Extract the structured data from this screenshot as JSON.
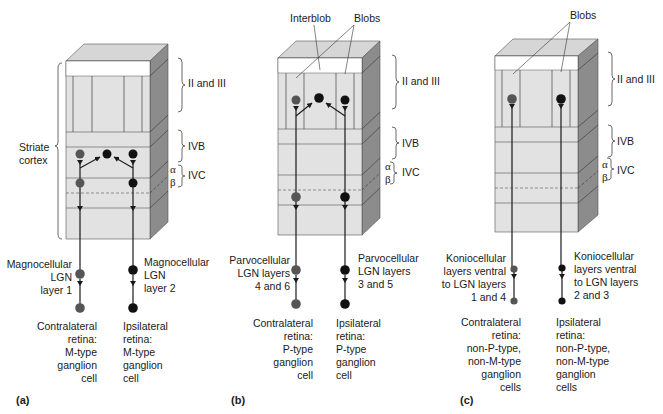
{
  "figure": {
    "colors": {
      "front_face": "#e2e2e2",
      "top_face": "#d6d6d6",
      "side_face": "#8c8c8c",
      "white_band": "#ffffff",
      "line": "#2a2a2a",
      "contralateral_neuron": "#555555",
      "ipsilateral_neuron": "#111111"
    },
    "layer_labels": {
      "layers_2_3": "II and III",
      "layer_4b": "IVB",
      "layer_4c": "IVC",
      "alpha": "α",
      "beta": "β"
    },
    "panels": [
      {
        "id": "a",
        "letter": "(a)",
        "side_label": "Striate\ncortex",
        "top_labels": [],
        "left_lgn": "Magnocellular\nLGN\nlayer 1",
        "right_lgn": "Magnocellular\nLGN\nlayer 2",
        "left_retina": "Contralateral\nretina:\nM-type\nganglion\ncell",
        "right_retina": "Ipsilateral\nretina:\nM-type\nganglion\ncell"
      },
      {
        "id": "b",
        "letter": "(b)",
        "top_labels": [
          "Interblob",
          "Blobs"
        ],
        "left_lgn": "Parvocellular\nLGN layers\n4 and 6",
        "right_lgn": "Parvocellular\nLGN layers\n3 and 5",
        "left_retina": "Contralateral\nretina:\nP-type\nganglion\ncell",
        "right_retina": "Ipsilateral\nretina:\nP-type\nganglion\ncell"
      },
      {
        "id": "c",
        "letter": "(c)",
        "top_labels": [
          "Blobs"
        ],
        "left_lgn": "Koniocellular\nlayers ventral\nto LGN layers\n1 and 4",
        "right_lgn": "Koniocellular\nlayers ventral\nto LGN layers\n2 and 3",
        "left_retina": "Contralateral\nretina:\nnon-P-type,\nnon-M-type\nganglion\ncells",
        "right_retina": "Ipsilateral\nretina:\nnon-P-type,\nnon-M-type\nganglion\ncells"
      }
    ]
  }
}
